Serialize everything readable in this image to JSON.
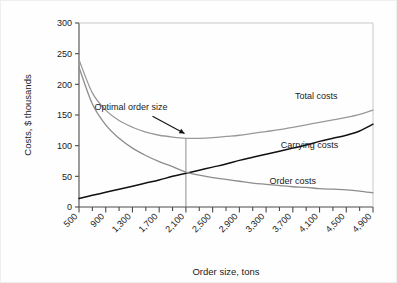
{
  "chart_data": {
    "type": "line",
    "title": "",
    "xlabel": "Order size, tons",
    "ylabel": "Costs, $ thousands",
    "xlim": [
      500,
      4900
    ],
    "ylim": [
      0,
      300
    ],
    "grid": false,
    "legend_position": "inline-right",
    "xticks": [
      "500",
      "900",
      "1,300",
      "1,700",
      "2,100",
      "2,500",
      "2,900",
      "3,300",
      "3,700",
      "4,100",
      "4,500",
      "4,900"
    ],
    "xtick_values": [
      500,
      900,
      1300,
      1700,
      2100,
      2500,
      2900,
      3300,
      3700,
      4100,
      4500,
      4900
    ],
    "xminor_step": 200,
    "yticks": [
      "0",
      "50",
      "100",
      "150",
      "200",
      "250",
      "300"
    ],
    "ytick_values": [
      0,
      50,
      100,
      150,
      200,
      250,
      300
    ],
    "x": [
      500,
      700,
      900,
      1100,
      1300,
      1500,
      1700,
      1900,
      2100,
      2300,
      2500,
      2700,
      2900,
      3100,
      3300,
      3500,
      3700,
      3900,
      4100,
      4300,
      4500,
      4700,
      4900
    ],
    "series": [
      {
        "name": "Total costs",
        "color": "#999999",
        "width": 1.3,
        "label_x": 4050,
        "label_y": 176,
        "values": [
          240,
          186,
          158,
          141,
          130,
          122,
          117,
          114,
          112,
          112,
          113,
          115,
          117,
          120,
          123,
          126,
          130,
          134,
          138,
          142,
          146,
          151,
          158
        ]
      },
      {
        "name": "Carrying costs",
        "color": "#111111",
        "width": 1.5,
        "label_x": 3950,
        "label_y": 96,
        "values": [
          14,
          19,
          24,
          29,
          34,
          39,
          44,
          50,
          55,
          60,
          65,
          70,
          76,
          81,
          86,
          91,
          96,
          101,
          107,
          112,
          117,
          124,
          135
        ]
      },
      {
        "name": "Order costs",
        "color": "#8d8d8d",
        "width": 1.3,
        "label_x": 3700,
        "label_y": 37,
        "values": [
          228,
          168,
          134,
          112,
          96,
          84,
          74,
          66,
          57,
          52,
          48,
          45,
          42,
          39,
          37,
          35,
          33,
          32,
          30,
          29,
          28,
          26,
          23
        ]
      }
    ],
    "annotations": [
      {
        "text": "Optimal order size",
        "text_x": 1280,
        "text_y": 158,
        "arrow_from_x": 1600,
        "arrow_from_y": 148,
        "arrow_to_x": 2080,
        "arrow_to_y": 120
      }
    ],
    "marker_line": {
      "name": "optimal-order-size-line",
      "x": 2100,
      "y_top": 112,
      "y_bottom": 0,
      "color": "#8d8d8d"
    }
  }
}
